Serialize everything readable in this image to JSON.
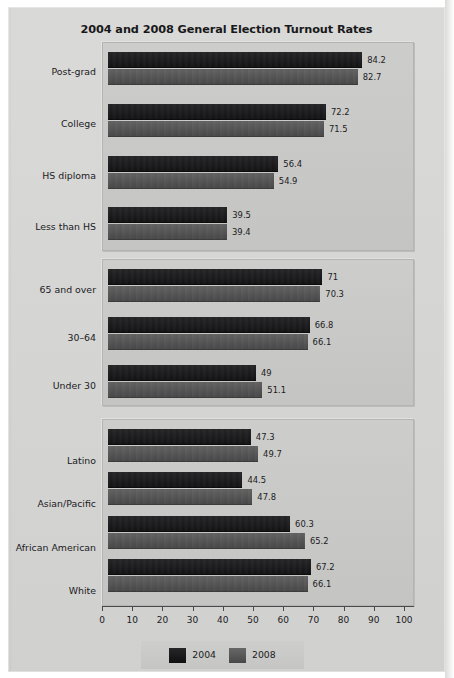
{
  "chart_data": {
    "type": "bar",
    "orientation": "horizontal",
    "title": "2004 and 2008 General Election Turnout Rates",
    "xlabel": "",
    "ylabel": "",
    "xlim": [
      0,
      100
    ],
    "xticks": [
      0,
      10,
      20,
      30,
      40,
      50,
      60,
      70,
      80,
      90,
      100
    ],
    "grid": false,
    "legend_position": "bottom-center",
    "series": [
      {
        "name": "2004",
        "color": "#18181a"
      },
      {
        "name": "2008",
        "color": "#565657"
      }
    ],
    "panels": [
      {
        "id": "education",
        "categories": [
          "Post-grad",
          "College",
          "HS diploma",
          "Less than HS"
        ],
        "values_2004": [
          84.2,
          72.2,
          56.4,
          39.5
        ],
        "values_2008": [
          82.7,
          71.5,
          54.9,
          39.4
        ]
      },
      {
        "id": "age",
        "categories": [
          "65 and over",
          "30–64",
          "Under 30"
        ],
        "values_2004": [
          71,
          66.8,
          49
        ],
        "values_2008": [
          70.3,
          66.1,
          51.1
        ]
      },
      {
        "id": "race",
        "categories": [
          "Latino",
          "Asian/Pacific",
          "African American",
          "White"
        ],
        "values_2004": [
          47.3,
          44.5,
          60.3,
          67.2
        ],
        "values_2008": [
          49.7,
          47.8,
          65.2,
          66.1
        ]
      }
    ]
  },
  "title": "2004 and 2008 General Election Turnout Rates",
  "axis": {
    "ticks": [
      "0",
      "10",
      "20",
      "30",
      "40",
      "50",
      "60",
      "70",
      "80",
      "90",
      "100"
    ]
  },
  "legend": {
    "items": [
      {
        "label": "2004"
      },
      {
        "label": "2008"
      }
    ]
  },
  "labels": {
    "post_grad": "Post-grad",
    "college": "College",
    "hs_diploma": "HS diploma",
    "less_than_hs": "Less than HS",
    "sixty_five_over": "65 and over",
    "thirty_sixtyfour": "30–64",
    "under_thirty": "Under 30",
    "latino": "Latino",
    "asian_pacific": "Asian/Pacific",
    "african_american": "African American",
    "white": "White"
  },
  "values": {
    "post_grad_2004": "84.2",
    "post_grad_2008": "82.7",
    "college_2004": "72.2",
    "college_2008": "71.5",
    "hs_diploma_2004": "56.4",
    "hs_diploma_2008": "54.9",
    "less_than_hs_2004": "39.5",
    "less_than_hs_2008": "39.4",
    "sixty_five_over_2004": "71",
    "sixty_five_over_2008": "70.3",
    "thirty_sixtyfour_2004": "66.8",
    "thirty_sixtyfour_2008": "66.1",
    "under_thirty_2004": "49",
    "under_thirty_2008": "51.1",
    "latino_2004": "47.3",
    "latino_2008": "49.7",
    "asian_pacific_2004": "44.5",
    "asian_pacific_2008": "47.8",
    "african_american_2004": "60.3",
    "african_american_2008": "65.2",
    "white_2004": "67.2",
    "white_2008": "66.1"
  }
}
